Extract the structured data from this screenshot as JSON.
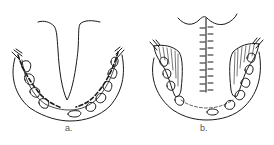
{
  "figure": {
    "panels": [
      {
        "id": "a",
        "label": "a.",
        "description": "V-shaped incision/flap with dashed margin along dental arch"
      },
      {
        "id": "b",
        "label": "b.",
        "description": "Midline closure with interrupted sutures, hatched lateral flaps"
      }
    ],
    "colors": {
      "line": "#1a1a1a",
      "background": "#ffffff",
      "caption": "#555555"
    }
  }
}
